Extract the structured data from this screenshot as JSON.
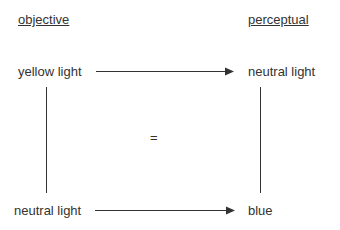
{
  "headers": {
    "left": "objective",
    "right": "perceptual"
  },
  "nodes": {
    "top_left": "yellow light",
    "top_right": "neutral light",
    "bottom_left": "neutral light",
    "bottom_right": "blue"
  },
  "center_symbol": "=",
  "colors": {
    "text": "#333333",
    "line": "#333333",
    "background": "#ffffff"
  }
}
